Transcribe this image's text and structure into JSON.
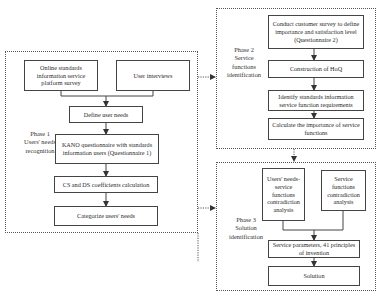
{
  "phases": [
    {
      "id": "phase1",
      "label_lines": [
        "Phase 1",
        "Users' needs",
        "recognition"
      ],
      "boxes": [
        {
          "id": "online-survey",
          "text": "Online standards information service platform survey"
        },
        {
          "id": "user-interviews",
          "text": "User interviews"
        },
        {
          "id": "define-needs",
          "text": "Define user needs"
        },
        {
          "id": "kano",
          "text": "KANO questionnaire with standards information users (Questionnaire 1)"
        },
        {
          "id": "cs-ds",
          "text": "CS and DS coefficients calculation"
        },
        {
          "id": "categorize",
          "text": "Categorize users' needs"
        }
      ]
    },
    {
      "id": "phase2",
      "label_lines": [
        "Phase 2",
        "Service",
        "functions",
        "identification"
      ],
      "boxes": [
        {
          "id": "customer-survey",
          "text": "Conduct customer survey to define importance and satisfaction level (Questionnaire 2)"
        },
        {
          "id": "hoq",
          "text": "Construction of HoQ"
        },
        {
          "id": "identify-reqs",
          "text": "Identify standards information service function requirements"
        },
        {
          "id": "calc-importance",
          "text": "Calculate the importance of service functions"
        }
      ]
    },
    {
      "id": "phase3",
      "label_lines": [
        "Phase 3",
        "Solution",
        "identification"
      ],
      "boxes": [
        {
          "id": "needs-contradiction",
          "text": "Users' needs-service functions contradiction analysis"
        },
        {
          "id": "functions-contradiction",
          "text": "Service functions contradiction analysis"
        },
        {
          "id": "service-params",
          "text": "Service parameters, 41 principles of invention"
        },
        {
          "id": "solution",
          "text": "Solution"
        }
      ]
    }
  ],
  "colors": {
    "line": "#444444",
    "dotted": "#555555",
    "background": "#ffffff"
  }
}
